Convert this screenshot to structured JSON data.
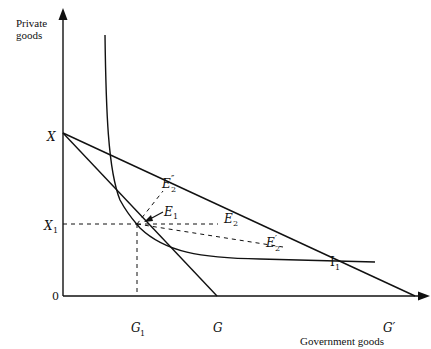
{
  "diagram": {
    "title_fragment": "",
    "y_axis_label_line1": "Private",
    "y_axis_label_line2": "goods",
    "x_axis_label": "Government goods",
    "origin_label": "0",
    "points": {
      "X": "X",
      "X1": "X",
      "X1_sub": "1",
      "G1": "G",
      "G1_sub": "1",
      "G": "G",
      "G_prime": "G′",
      "E1": "E",
      "E1_sub": "1",
      "E2": "E",
      "E2_sub": "2",
      "E2_prime": "E",
      "E2_prime_sub": "2",
      "E2_prime_mark": "′",
      "E2_dprime": "E",
      "E2_dprime_sub": "2",
      "E2_dprime_mark": "″",
      "I1": "I",
      "I1_sub": "1"
    },
    "elements": [
      "budget line X–G",
      "budget line X–G′",
      "indifference curve I1 tangent at E1",
      "dashed projections from E1 to X1 and G1",
      "dashed lines from E1 to E2, E2′, E2″"
    ]
  }
}
